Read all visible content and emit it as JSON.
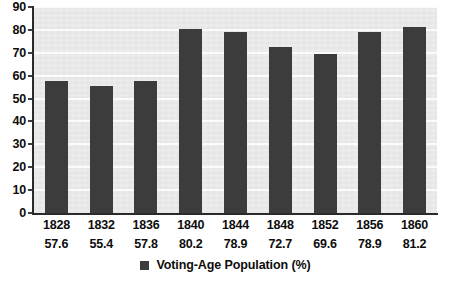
{
  "chart_data": {
    "type": "bar",
    "title": "",
    "xlabel": "",
    "ylabel": "",
    "categories": [
      "1828",
      "1832",
      "1836",
      "1840",
      "1844",
      "1848",
      "1852",
      "1856",
      "1860"
    ],
    "values": [
      57.6,
      55.4,
      57.8,
      80.2,
      78.9,
      72.7,
      69.6,
      78.9,
      81.2
    ],
    "value_labels": [
      "57.6",
      "55.4",
      "57.8",
      "80.2",
      "78.9",
      "72.7",
      "69.6",
      "78.9",
      "81.2"
    ],
    "ylim": [
      0,
      90
    ],
    "ytick_step": 10,
    "ytick_labels": [
      "90",
      "80",
      "70",
      "60",
      "50",
      "40",
      "30",
      "20",
      "10",
      "0"
    ],
    "grid": true,
    "legend_position": "bottom",
    "series": [
      {
        "name": "Voting-Age Population (%)",
        "color": "#3c3c3c",
        "values": [
          57.6,
          55.4,
          57.8,
          80.2,
          78.9,
          72.7,
          69.6,
          78.9,
          81.2
        ]
      }
    ]
  },
  "legend": {
    "label": "Voting-Age Population (%)",
    "swatch_color": "#3c3c3c"
  },
  "colors": {
    "bar": "#3c3c3c",
    "plot_background": "#e9e9e9",
    "gridline": "#fbfbfb",
    "axis": "#2a2a2a",
    "text": "#0d0d0d",
    "page_background": "#ffffff"
  }
}
